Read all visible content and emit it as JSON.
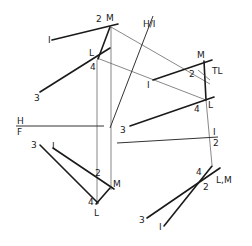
{
  "labels": {
    "top_view": {
      "p1": "I",
      "p2": "2",
      "pM": "M",
      "pL": "L",
      "p4": "4",
      "p3": "3"
    },
    "hinge_hv": "H/I",
    "hinge_hf_top": "H",
    "hinge_hf_bottom": "F",
    "aux_view": {
      "pM": "M",
      "p2": "2",
      "p1": "I",
      "pL": "L",
      "p4": "4",
      "p3": "3",
      "true_length": "TL"
    },
    "hinge_12_top": "I",
    "hinge_12_bottom": "2",
    "front_view": {
      "p3": "3",
      "p1": "I",
      "p2": "2",
      "pM": "M",
      "p4": "4",
      "pL": "L"
    },
    "point_view": {
      "p4": "4",
      "p2": "2",
      "pLM": "L,M",
      "p3": "3",
      "p1": "I"
    }
  },
  "colors": {
    "line": "#1a1a1a",
    "projector": "#555555"
  }
}
